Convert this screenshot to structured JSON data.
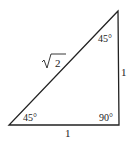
{
  "diagram": {
    "type": "right-triangle",
    "hypotenuse_label_radicand": "2",
    "hypotenuse_label": "√2",
    "vertical_side_label": "1",
    "horizontal_side_label": "1",
    "angles": {
      "top": "45°",
      "bottom_left": "45°",
      "bottom_right": "90°"
    },
    "stroke_color": "#222222"
  }
}
